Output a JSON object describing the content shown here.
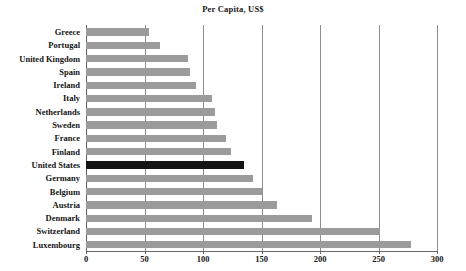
{
  "chart_data": {
    "type": "bar",
    "orientation": "horizontal",
    "title": "Per Capita, US$",
    "xlabel": "",
    "ylabel": "",
    "xlim": [
      0,
      300
    ],
    "xticks": [
      0,
      50,
      100,
      150,
      200,
      250,
      300
    ],
    "xtick_labels": [
      "0",
      "50",
      "100",
      "150",
      "200",
      "250",
      "300"
    ],
    "grid": true,
    "grid_axis": "x",
    "legend": false,
    "categories": [
      "Greece",
      "Portugal",
      "United Kingdom",
      "Spain",
      "Ireland",
      "Italy",
      "Netherlands",
      "Sweden",
      "France",
      "Finland",
      "United States",
      "Germany",
      "Belgium",
      "Austria",
      "Denmark",
      "Switzerland",
      "Luxembourg"
    ],
    "values": [
      54,
      63,
      87,
      89,
      94,
      108,
      110,
      112,
      120,
      124,
      135,
      143,
      150,
      163,
      193,
      251,
      278
    ],
    "highlight_category": "United States",
    "colors": {
      "bar": "#9b9b9b",
      "bar_highlight": "#141414",
      "gridline": "#8d8d8d",
      "axis": "#6a6a6a",
      "text": "#141414",
      "background": "#ffffff"
    }
  }
}
